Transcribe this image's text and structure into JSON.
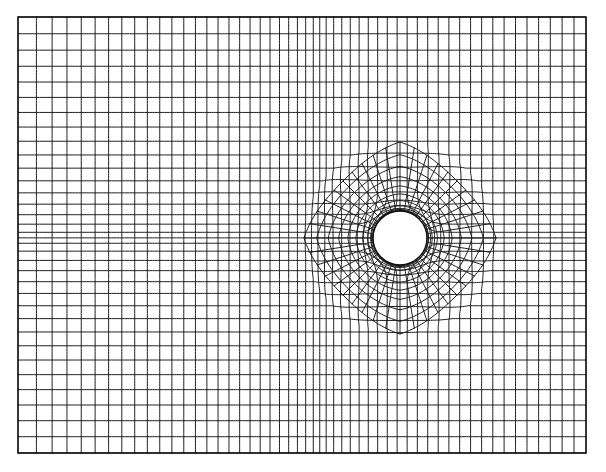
{
  "figure": {
    "kind": "mesh-plot",
    "background_color": "#ffffff",
    "line_color": "#1d1d1d",
    "boundary_color": "#111111",
    "line_width_px": 1,
    "canvas": {
      "width": 606,
      "height": 472
    }
  },
  "chart_data": {
    "type": "mesh",
    "xlabel": "",
    "ylabel": "",
    "grid": true,
    "legend": "none",
    "domain": {
      "shape": "rectangle",
      "x_min": 18,
      "x_max": 586,
      "y_min": 17,
      "y_max": 453,
      "width": 568,
      "height": 436
    },
    "hole": {
      "shape": "circle",
      "center_x": 400,
      "center_y": 238,
      "radius": 27
    },
    "topology": "O-grid around circular hole blended into graded Cartesian background grid",
    "circumferential_divisions": 40,
    "radial_rings": 9,
    "outer_ring_radius": 96,
    "background_columns": 52,
    "background_rows": 34,
    "grading": {
      "x_clustering": "cells compress toward the hole and toward the right edge",
      "y_clustering": "cells compress toward the horizontal symmetry line through the hole center",
      "radial_clustering": "rings tightest at the hole boundary, expanding outward"
    },
    "symmetry_lines": {
      "horizontal_y": 238,
      "vertical_x": 400
    }
  }
}
